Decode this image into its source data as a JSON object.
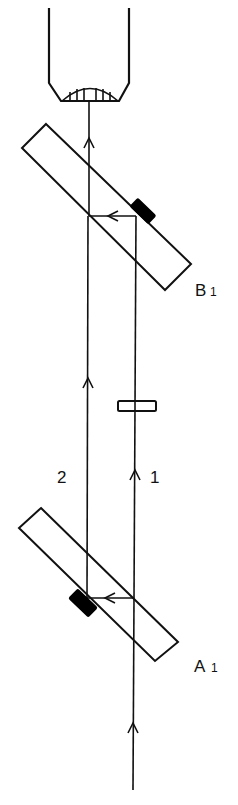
{
  "diagram": {
    "type": "optical-beam-path",
    "colors": {
      "stroke": "#111111",
      "background": "#ffffff",
      "block": "#000000"
    },
    "labels": {
      "plate_b_main": "B",
      "plate_b_sub": "1",
      "plate_a_main": "A",
      "plate_a_sub": "1",
      "beam_1": "1",
      "beam_2": "2"
    },
    "components": [
      {
        "id": "detector-tube",
        "description": "cup-shaped receiver with hatched dome at top"
      },
      {
        "id": "plate-b1",
        "description": "tilted plate B1 with black block on upper-right face"
      },
      {
        "id": "compensator",
        "description": "small rectangle on beam 1"
      },
      {
        "id": "plate-a1",
        "description": "tilted plate A1 with black block on lower-left face"
      }
    ],
    "beams": [
      {
        "id": "beam-1",
        "label": "1",
        "direction": "up"
      },
      {
        "id": "beam-2",
        "label": "2",
        "direction": "up"
      }
    ]
  }
}
